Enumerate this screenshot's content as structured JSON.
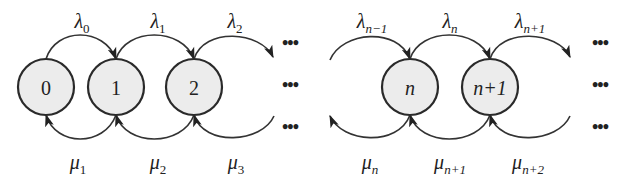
{
  "diagram": {
    "colors": {
      "node_fill": "#ececec",
      "stroke": "#2a2a2a",
      "text": "#222222",
      "background": "#ffffff"
    },
    "nodes": [
      {
        "id": "0",
        "label": "0",
        "italic": false,
        "cx": 46
      },
      {
        "id": "1",
        "label": "1",
        "italic": false,
        "cx": 116
      },
      {
        "id": "2",
        "label": "2",
        "italic": false,
        "cx": 194
      },
      {
        "id": "n",
        "label": "n",
        "italic": true,
        "cx": 410
      },
      {
        "id": "n+1",
        "label": "n+1",
        "italic": true,
        "cx": 490
      }
    ],
    "birth_rates": [
      {
        "symbol": "λ",
        "sub": "0",
        "x": 82
      },
      {
        "symbol": "λ",
        "sub": "1",
        "x": 158
      },
      {
        "symbol": "λ",
        "sub": "2",
        "x": 235
      },
      {
        "symbol": "λ",
        "sub": "n−1",
        "x": 372
      },
      {
        "symbol": "λ",
        "sub": "n",
        "x": 450
      },
      {
        "symbol": "λ",
        "sub": "n+1",
        "x": 530
      }
    ],
    "death_rates": [
      {
        "symbol": "μ",
        "sub": "1",
        "x": 78
      },
      {
        "symbol": "μ",
        "sub": "2",
        "x": 158
      },
      {
        "symbol": "μ",
        "sub": "3",
        "x": 236
      },
      {
        "symbol": "μ",
        "sub": "n",
        "x": 370
      },
      {
        "symbol": "μ",
        "sub": "n+1",
        "x": 450
      },
      {
        "symbol": "μ",
        "sub": "n+2",
        "x": 528
      }
    ],
    "ellipsis": {
      "glyph": "•••",
      "middle_x": 290,
      "right_x": 600,
      "rows_y": [
        44,
        86,
        128
      ]
    }
  }
}
